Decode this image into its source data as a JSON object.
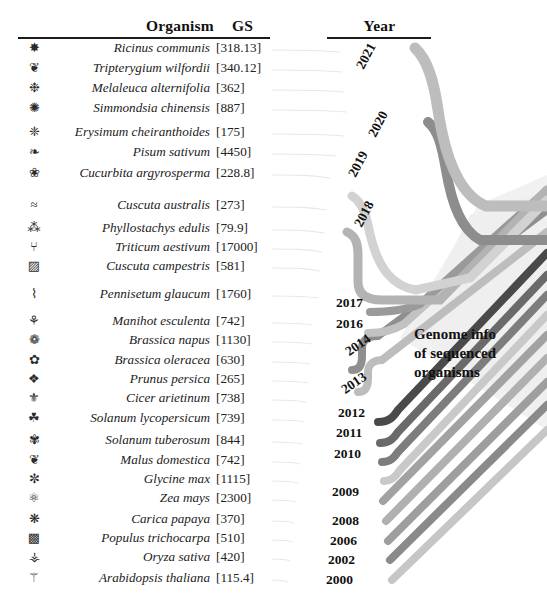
{
  "figure": {
    "title_blurb": "Genome info of sequenced organisms",
    "blurb_lines": [
      "Genome info",
      "of sequenced",
      "organisms"
    ]
  },
  "headers": {
    "organism": "Organism",
    "gs": "GS",
    "year": "Year"
  },
  "chart_data": {
    "type": "table",
    "title": "Genome info of sequenced organisms",
    "columns": [
      "Organism",
      "GS",
      "Year"
    ],
    "note": "GS = genome size in Mb, shown in square brackets. Ribbons link each organism row to its publication year on the right.",
    "rows": [
      {
        "organism": "Ricinus communis",
        "gs": "[318.13]",
        "gs_value": 318.13,
        "year": "2021",
        "icon": "plant-castor-icon",
        "ribbon_color": "#b9b9b9"
      },
      {
        "organism": "Tripterygium wilfordii",
        "gs": "[340.12]",
        "gs_value": 340.12,
        "year": "2021",
        "icon": "plant-vine-icon",
        "ribbon_color": "#b9b9b9"
      },
      {
        "organism": "Melaleuca alternifolia",
        "gs": "[362]",
        "gs_value": 362,
        "year": "2021",
        "icon": "plant-shrub-icon",
        "ribbon_color": "#b9b9b9"
      },
      {
        "organism": "Simmondsia chinensis",
        "gs": "[887]",
        "gs_value": 887,
        "year": "2021",
        "icon": "plant-jojoba-icon",
        "ribbon_color": "#b9b9b9"
      },
      {
        "organism": "Erysimum cheiranthoides",
        "gs": "[175]",
        "gs_value": 175,
        "year": "2021",
        "icon": "plant-mustard-icon",
        "ribbon_color": "#b9b9b9"
      },
      {
        "organism": "Pisum sativum",
        "gs": "[4450]",
        "gs_value": 4450,
        "year": "2020",
        "icon": "plant-pea-icon",
        "ribbon_color": "#8d8d8d"
      },
      {
        "organism": "Cucurbita argyrosperma",
        "gs": "[228.8]",
        "gs_value": 228.8,
        "year": "2020",
        "icon": "plant-squash-icon",
        "ribbon_color": "#8d8d8d"
      },
      {
        "organism": "Cuscuta australis",
        "gs": "[273]",
        "gs_value": 273,
        "year": "2019",
        "icon": "plant-dodder-icon",
        "ribbon_color": "#cfcfcf"
      },
      {
        "organism": "Phyllostachys edulis",
        "gs": "[79.9]",
        "gs_value": 79.9,
        "year": "2019",
        "icon": "plant-bamboo-icon",
        "ribbon_color": "#cfcfcf"
      },
      {
        "organism": "Triticum aestivum",
        "gs": "[17000]",
        "gs_value": 17000,
        "year": "2018",
        "icon": "plant-wheat-icon",
        "ribbon_color": "#a8a8a8"
      },
      {
        "organism": "Cuscuta campestris",
        "gs": "[581]",
        "gs_value": 581,
        "year": "2018",
        "icon": "plant-dodder2-icon",
        "ribbon_color": "#a8a8a8"
      },
      {
        "organism": "Pennisetum glaucum",
        "gs": "[1760]",
        "gs_value": 1760,
        "year": "2017",
        "icon": "plant-millet-icon",
        "ribbon_color": "#9a9a9a"
      },
      {
        "organism": "Manihot esculenta",
        "gs": "[742]",
        "gs_value": 742,
        "year": "2016",
        "icon": "plant-cassava-icon",
        "ribbon_color": "#c2c2c2"
      },
      {
        "organism": "Brassica napus",
        "gs": "[1130]",
        "gs_value": 1130,
        "year": "2014",
        "icon": "plant-rapeseed-icon",
        "ribbon_color": "#8f8f8f"
      },
      {
        "organism": "Brassica oleracea",
        "gs": "[630]",
        "gs_value": 630,
        "year": "2014",
        "icon": "plant-cabbage-icon",
        "ribbon_color": "#8f8f8f"
      },
      {
        "organism": "Prunus persica",
        "gs": "[265]",
        "gs_value": 265,
        "year": "2013",
        "icon": "plant-peach-icon",
        "ribbon_color": "#bdbdbd"
      },
      {
        "organism": "Cicer arietinum",
        "gs": "[738]",
        "gs_value": 738,
        "year": "2013",
        "icon": "plant-chickpea-icon",
        "ribbon_color": "#bdbdbd"
      },
      {
        "organism": "Solanum lycopersicum",
        "gs": "[739]",
        "gs_value": 739,
        "year": "2012",
        "icon": "plant-tomato-icon",
        "ribbon_color": "#4a4a4a"
      },
      {
        "organism": "Solanum tuberosum",
        "gs": "[844]",
        "gs_value": 844,
        "year": "2011",
        "icon": "plant-potato-icon",
        "ribbon_color": "#6a6a6a"
      },
      {
        "organism": "Malus domestica",
        "gs": "[742]",
        "gs_value": 742,
        "year": "2010",
        "icon": "plant-apple-icon",
        "ribbon_color": "#7d7d7d"
      },
      {
        "organism": "Glycine max",
        "gs": "[1115]",
        "gs_value": 1115,
        "year": "2010",
        "icon": "plant-soybean-icon",
        "ribbon_color": "#c9c9c9"
      },
      {
        "organism": "Zea mays",
        "gs": "[2300]",
        "gs_value": 2300,
        "year": "2009",
        "icon": "plant-maize-icon",
        "ribbon_color": "#a2a2a2"
      },
      {
        "organism": "Carica papaya",
        "gs": "[370]",
        "gs_value": 370,
        "year": "2008",
        "icon": "plant-papaya-icon",
        "ribbon_color": "#b0b0b0"
      },
      {
        "organism": "Populus trichocarpa",
        "gs": "[510]",
        "gs_value": 510,
        "year": "2006",
        "icon": "plant-poplar-icon",
        "ribbon_color": "#9e9e9e"
      },
      {
        "organism": "Oryza sativa",
        "gs": "[420]",
        "gs_value": 420,
        "year": "2002",
        "icon": "plant-rice-icon",
        "ribbon_color": "#8a8a8a"
      },
      {
        "organism": "Arabidopsis thaliana",
        "gs": "[115.4]",
        "gs_value": 115.4,
        "year": "2000",
        "icon": "plant-arabidopsis-icon",
        "ribbon_color": "#c6c6c6"
      }
    ],
    "years": [
      "2021",
      "2020",
      "2019",
      "2018",
      "2017",
      "2016",
      "2014",
      "2013",
      "2012",
      "2011",
      "2010",
      "2009",
      "2008",
      "2006",
      "2002",
      "2000"
    ]
  },
  "colors": {
    "rule": "#1b1b1b",
    "text": "#222222",
    "funnel": "#ededed"
  }
}
